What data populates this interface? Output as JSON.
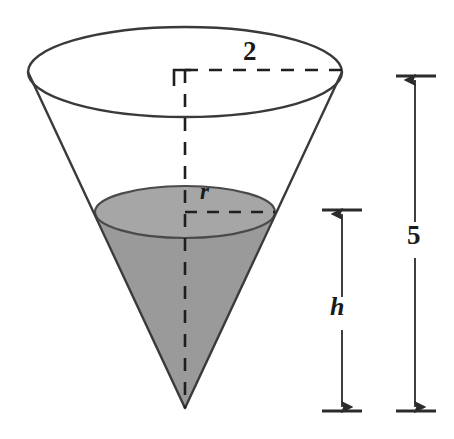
{
  "figure": {
    "colors": {
      "outline": "#3a3a3a",
      "liquid_fill": "#9a9a9a",
      "liquid_surface_fill": "#a6a6a6",
      "dashed": "#1f1f1f",
      "background": "#ffffff",
      "text": "#1a1a1a"
    },
    "geometry": {
      "top_ellipse": {
        "cx": 185,
        "cy": 72,
        "rx": 157,
        "ry": 45
      },
      "liquid_ellipse": {
        "cx": 185,
        "cy": 212,
        "rx": 90,
        "ry": 26
      },
      "apex": {
        "x": 185,
        "y": 408
      },
      "axis": {
        "x": 185,
        "y_top": 70,
        "y_bottom": 408
      }
    },
    "labels": {
      "top_radius": "2",
      "liquid_radius": "r",
      "liquid_height": "h",
      "cone_height": "5"
    },
    "dimensions": {
      "cone_height_line": {
        "x": 415,
        "y_top": 76,
        "y_bottom": 411,
        "value": "5"
      },
      "liquid_height_line": {
        "x": 342,
        "y_top": 211,
        "y_bottom": 411,
        "value": "h"
      },
      "top_radius_line": {
        "y": 70,
        "x_start": 185,
        "x_end": 342,
        "value": "2"
      },
      "liquid_radius_line": {
        "y": 212,
        "x_start": 185,
        "x_end": 275,
        "value": "r"
      }
    }
  }
}
